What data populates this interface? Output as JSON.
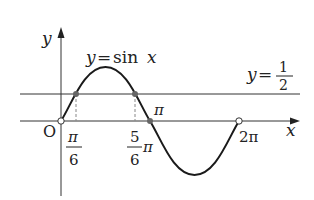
{
  "diagram": {
    "curve_label": "y=sin x",
    "curve_label_y": "y",
    "curve_label_eq": "=",
    "curve_label_fn": "sin",
    "curve_label_var": "x",
    "line_label_y": "y",
    "line_label_eq": "=",
    "line_label_num": "1",
    "line_label_den": "2",
    "axis_x_label": "x",
    "axis_y_label": "y",
    "origin_label": "O",
    "ticks": {
      "pi_over_6_num": "π",
      "pi_over_6_den": "6",
      "five_pi_over_6_num": "5",
      "five_pi_over_6_den": "6",
      "five_pi_over_6_suffix": "π",
      "pi": "π",
      "two_pi": "2π"
    },
    "intersection_points": [
      "π/6",
      "5π/6"
    ],
    "open_points": [
      "0",
      "2π"
    ],
    "closed_points": [
      "π/6",
      "5π/6",
      "π"
    ],
    "colors": {
      "curve": "#1a1a1a",
      "axes": "#333333",
      "line": "#333333",
      "dot": "#666666",
      "dashed": "#888888"
    }
  }
}
